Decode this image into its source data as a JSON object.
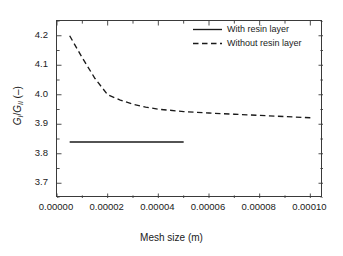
{
  "chart_data": {
    "type": "line",
    "title": "",
    "xlabel": "Mesh size (m)",
    "ylabel": "G_I/G_II (-)",
    "ylabel_parts": {
      "g1": "G",
      "sub1": "I",
      "slash": "/",
      "g2": "G",
      "sub2": "II",
      "unit": " (–)"
    },
    "xlim": [
      0.0,
      0.000105
    ],
    "ylim": [
      3.65,
      4.25
    ],
    "xticks": [
      0.0,
      2e-05,
      4e-05,
      6e-05,
      8e-05,
      0.0001
    ],
    "xticklabels": [
      "0.00000",
      "0.00002",
      "0.00004",
      "0.00006",
      "0.00008",
      "0.00010"
    ],
    "yticks": [
      3.7,
      3.8,
      3.9,
      4.0,
      4.1,
      4.2
    ],
    "yticklabels": [
      "3.7",
      "3.8",
      "3.9",
      "4.0",
      "4.1",
      "4.2"
    ],
    "minor_tick_step_y": 0.05,
    "minor_tick_step_x": 1e-05,
    "grid": false,
    "legend_position": "top-right",
    "series": [
      {
        "name": "With resin layer",
        "style": "solid",
        "color": "#1a1a1a",
        "x": [
          5e-06,
          5e-05
        ],
        "values": [
          3.84,
          3.84
        ]
      },
      {
        "name": "Without resin layer",
        "style": "dashed",
        "color": "#1a1a1a",
        "x": [
          5e-06,
          1e-05,
          1.5e-05,
          2e-05,
          2.5e-05,
          3e-05,
          3.5e-05,
          4e-05,
          5e-05,
          6e-05,
          7e-05,
          8e-05,
          9e-05,
          0.0001
        ],
        "values": [
          4.2,
          4.125,
          4.055,
          4.0,
          3.982,
          3.968,
          3.958,
          3.951,
          3.943,
          3.938,
          3.934,
          3.93,
          3.926,
          3.922
        ]
      }
    ]
  },
  "legend": {
    "items": [
      {
        "label": "With resin layer",
        "style": "solid"
      },
      {
        "label": "Without resin layer",
        "style": "dashed"
      }
    ]
  }
}
